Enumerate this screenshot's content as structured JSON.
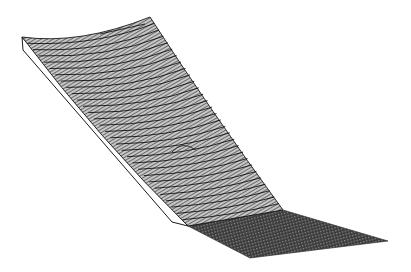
{
  "figure": {
    "description": "3D wireframe surface plot: a curved sheet sloping down from upper-left to a fold, continuing into a flat dense mesh plane at lower-right",
    "background_color": "#ffffff",
    "line_color": "#000000",
    "mesh_fill_upper": "#9a9a9a",
    "mesh_fill_flat": "#4a4a4a",
    "side_face_color": "#ffffff",
    "features": {
      "curved_sheet": "upper sloped surface with ~30 curved contour lines",
      "fold": "sharp transition into flat plane",
      "flat_plane": "dense dark mesh in lower-right",
      "bump": "small local bump near center of curved sheet",
      "side_face": "thin white edge face along left boundary"
    }
  },
  "geometry": {
    "top_left": [
      22,
      37
    ],
    "top_right": [
      150,
      17
    ],
    "left_face_corner": [
      23,
      50
    ],
    "fold_left": [
      188,
      226
    ],
    "fold_right": [
      283,
      210
    ],
    "flat_right": [
      388,
      241
    ],
    "flat_bottom": [
      250,
      258
    ],
    "bump_center": [
      185,
      150
    ],
    "contour_count": 30
  }
}
